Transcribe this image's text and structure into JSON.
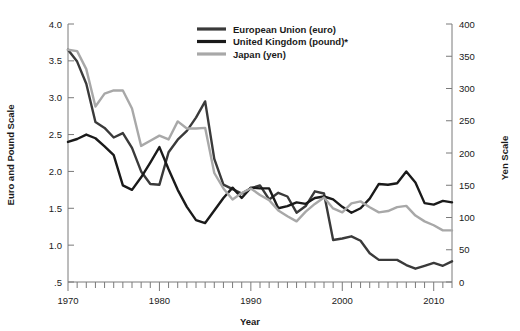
{
  "chart_data": {
    "type": "line",
    "title": "",
    "xlabel": "Year",
    "ylabel": "Euro and Pound Scale",
    "y2label": "Yen Scale",
    "xlim": [
      1970,
      2012
    ],
    "ylim": [
      0.5,
      4.0
    ],
    "y2lim": [
      0,
      400
    ],
    "grid": false,
    "legend_position": "top-center",
    "xticks": [
      1970,
      1980,
      1990,
      2000,
      2010
    ],
    "xtick_labels": [
      "1970",
      "1980",
      "1990",
      "2000",
      "2010"
    ],
    "minor_xtick_interval": 1,
    "yticks": [
      0.5,
      1.0,
      1.5,
      2.0,
      2.5,
      3.0,
      3.5,
      4.0
    ],
    "ytick_labels": [
      ".5",
      "1.0",
      "1.5",
      "2.0",
      "2.5",
      "3.0",
      "3.5",
      "4.0"
    ],
    "y2ticks": [
      0,
      50,
      100,
      150,
      200,
      250,
      300,
      350,
      400
    ],
    "y2tick_labels": [
      "0",
      "50",
      "100",
      "150",
      "200",
      "250",
      "300",
      "350",
      "400"
    ],
    "x": [
      1970,
      1971,
      1972,
      1973,
      1974,
      1975,
      1976,
      1977,
      1978,
      1979,
      1980,
      1981,
      1982,
      1983,
      1984,
      1985,
      1986,
      1987,
      1988,
      1989,
      1990,
      1991,
      1992,
      1993,
      1994,
      1995,
      1996,
      1997,
      1998,
      1999,
      2000,
      2001,
      2002,
      2003,
      2004,
      2005,
      2006,
      2007,
      2008,
      2009,
      2010,
      2011,
      2012
    ],
    "series": [
      {
        "name": "European Union (euro)",
        "axis": "left",
        "color": "#3a3a3a",
        "values": [
          3.65,
          3.49,
          3.19,
          2.67,
          2.59,
          2.46,
          2.52,
          2.32,
          2.0,
          1.83,
          1.82,
          2.26,
          2.43,
          2.55,
          2.73,
          2.95,
          2.17,
          1.82,
          1.76,
          1.7,
          1.77,
          1.81,
          1.62,
          1.71,
          1.66,
          1.44,
          1.53,
          1.73,
          1.7,
          1.07,
          1.09,
          1.12,
          1.06,
          0.89,
          0.8,
          0.8,
          0.8,
          0.73,
          0.68,
          0.72,
          0.76,
          0.72,
          0.78
        ]
      },
      {
        "name": "United Kingdom (pound)*",
        "axis": "left",
        "color": "#1a1a1a",
        "values": [
          2.4,
          2.44,
          2.5,
          2.45,
          2.34,
          2.22,
          1.81,
          1.75,
          1.92,
          2.12,
          2.33,
          2.03,
          1.75,
          1.52,
          1.34,
          1.3,
          1.47,
          1.64,
          1.78,
          1.64,
          1.78,
          1.77,
          1.77,
          1.5,
          1.53,
          1.58,
          1.56,
          1.64,
          1.66,
          1.62,
          1.52,
          1.44,
          1.5,
          1.63,
          1.83,
          1.82,
          1.84,
          2.0,
          1.85,
          1.57,
          1.55,
          1.6,
          1.58
        ]
      },
      {
        "name": "Japan (yen)",
        "axis": "right",
        "color": "#a8a8a8",
        "values": [
          360,
          358,
          330,
          272,
          292,
          297,
          297,
          269,
          211,
          219,
          227,
          221,
          249,
          238,
          238,
          239,
          169,
          145,
          128,
          138,
          145,
          135,
          127,
          111,
          102,
          94,
          109,
          121,
          131,
          114,
          108,
          122,
          125,
          116,
          108,
          110,
          116,
          118,
          103,
          94,
          88,
          80,
          80
        ]
      }
    ]
  },
  "legend": {
    "items": [
      {
        "label": "European Union (euro)",
        "color": "#3a3a3a"
      },
      {
        "label": "United Kingdom (pound)*",
        "color": "#1a1a1a"
      },
      {
        "label": "Japan (yen)",
        "color": "#a8a8a8"
      }
    ]
  },
  "axes": {
    "left_title": "Euro and Pound Scale",
    "right_title": "Yen Scale",
    "x_title": "Year"
  }
}
